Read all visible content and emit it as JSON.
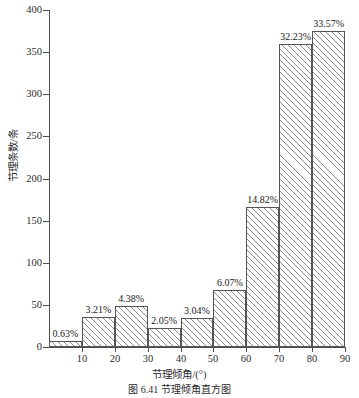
{
  "chart_data": {
    "type": "bar",
    "title": "",
    "caption": "图 6.41    节理倾角直方图",
    "xlabel": "节理倾角/(°)",
    "ylabel": "节理条数/条",
    "categories": [
      "0~10",
      "10~20",
      "20~30",
      "30~40",
      "40~50",
      "50~60",
      "60~70",
      "70~80",
      "80~90"
    ],
    "bin_edges": [
      0,
      10,
      20,
      30,
      40,
      50,
      60,
      70,
      80,
      90
    ],
    "values": [
      7,
      36,
      49,
      23,
      34,
      68,
      166,
      360,
      375
    ],
    "data_labels": [
      "0.63%",
      "3.21%",
      "4.38%",
      "2.05%",
      "3.04%",
      "6.07%",
      "14.82%",
      "32.23%",
      "33.57%"
    ],
    "percentages": [
      0.63,
      3.21,
      4.38,
      2.05,
      3.04,
      6.07,
      14.82,
      32.23,
      33.57
    ],
    "xlim": [
      0,
      90
    ],
    "ylim": [
      0,
      400
    ],
    "xticks": [
      10,
      20,
      30,
      40,
      50,
      60,
      70,
      80,
      90
    ],
    "xtick_labels": [
      "10",
      "20",
      "30",
      "40",
      "50",
      "60",
      "70",
      "80",
      "90"
    ],
    "yticks": [
      0,
      50,
      100,
      150,
      200,
      250,
      300,
      350,
      400
    ],
    "ytick_labels": [
      "0",
      "50",
      "100",
      "150",
      "200",
      "250",
      "300",
      "350",
      "400"
    ],
    "grid": false,
    "legend": null,
    "bar_style": {
      "fill": "#ffffff",
      "hatch": "diagonal-forward",
      "hatch_color": "#8c8c8c",
      "edge_color": "#555555"
    },
    "axis_color": "#4d4d4d",
    "text_color": "#1a1a1a"
  }
}
